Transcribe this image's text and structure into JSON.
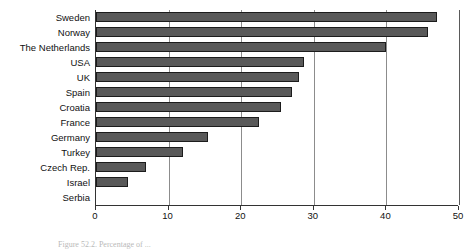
{
  "chart_data": {
    "type": "bar",
    "orientation": "horizontal",
    "title": "",
    "xlabel": "",
    "ylabel": "",
    "xlim": [
      0,
      50
    ],
    "xticks": [
      0,
      10,
      20,
      30,
      40,
      50
    ],
    "grid": true,
    "legend": null,
    "categories": [
      "Sweden",
      "Norway",
      "The Netherlands",
      "USA",
      "UK",
      "Spain",
      "Croatia",
      "France",
      "Germany",
      "Turkey",
      "Czech Rep.",
      "Israel",
      "Serbia"
    ],
    "values": [
      47,
      45.7,
      40,
      28.6,
      28,
      27,
      25.5,
      22.5,
      15.4,
      12,
      6.9,
      4.4,
      0
    ],
    "bar_color": "#595959",
    "bar_border_color": "#1c1c1c",
    "grid_color": "#8c8c8c",
    "axis_color": "#333333"
  },
  "caption": {
    "text": "Figure 52.2. Percentage of ..."
  }
}
